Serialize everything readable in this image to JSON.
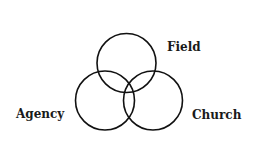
{
  "diagram": {
    "type": "venn",
    "circles": [
      {
        "label": "Field",
        "cx": 126.5,
        "cy": 63,
        "r": 29.5
      },
      {
        "label": "Agency",
        "cx": 105,
        "cy": 100.5,
        "r": 29.5
      },
      {
        "label": "Church",
        "cx": 153,
        "cy": 100.5,
        "r": 29.5
      }
    ],
    "stroke_color": "#111111"
  }
}
